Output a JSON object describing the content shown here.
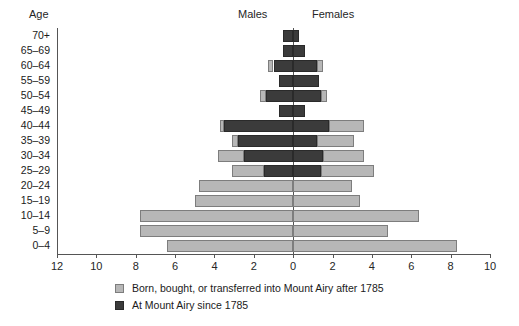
{
  "header": {
    "age_title": "Age",
    "males_title": "Males",
    "females_title": "Females"
  },
  "legend": [
    {
      "key": "after",
      "label": "Born, bought, or transferred into Mount Airy after 1785",
      "color": "#b7b7b7"
    },
    {
      "key": "since",
      "label": "At Mount Airy since 1785",
      "color": "#3b3b3b"
    }
  ],
  "axis": {
    "tick_labels": [
      "12",
      "10",
      "8",
      "6",
      "4",
      "2",
      "0",
      "2",
      "4",
      "6",
      "8",
      "10"
    ],
    "tick_values": [
      -12,
      -10,
      -8,
      -6,
      -4,
      -2,
      0,
      2,
      4,
      6,
      8,
      10
    ],
    "xmin": -12,
    "xmax": 10,
    "zero_label": "0"
  },
  "chart_data": {
    "type": "bar",
    "title": "",
    "subtitle": "",
    "xlabel": "",
    "ylabel": "Age",
    "xlim": [
      -12,
      10
    ],
    "grid": false,
    "legend_position": "bottom-left",
    "orientation": "horizontal-population-pyramid",
    "categories": [
      "70+",
      "65–69",
      "60–64",
      "55–59",
      "50–54",
      "45–49",
      "40–44",
      "35–39",
      "30–34",
      "25–29",
      "20–24",
      "15–19",
      "10–14",
      "5–9",
      "0–4"
    ],
    "series": [
      {
        "name": "Males – At Mount Airy since 1785",
        "side": "left",
        "stack": "dark",
        "values": [
          0.5,
          0.5,
          1.0,
          0.7,
          1.4,
          0.7,
          3.5,
          2.8,
          2.5,
          1.5,
          0.0,
          0.0,
          0.0,
          0.0,
          0.0
        ]
      },
      {
        "name": "Males – Born, bought, or transferred into Mount Airy after 1785",
        "side": "left",
        "stack": "light",
        "values": [
          0.0,
          0.0,
          0.3,
          0.0,
          0.3,
          0.0,
          0.2,
          0.3,
          1.3,
          1.6,
          4.8,
          5.0,
          7.8,
          7.8,
          6.4
        ]
      },
      {
        "name": "Females – At Mount Airy since 1785",
        "side": "right",
        "stack": "dark",
        "values": [
          0.3,
          0.6,
          1.2,
          1.3,
          1.4,
          0.6,
          1.8,
          1.2,
          1.5,
          1.4,
          0.0,
          0.0,
          0.0,
          0.0,
          0.0
        ]
      },
      {
        "name": "Females – Born, bought, or transferred into Mount Airy after 1785",
        "side": "right",
        "stack": "light",
        "values": [
          0.0,
          0.0,
          0.3,
          0.0,
          0.3,
          0.0,
          1.8,
          1.9,
          2.1,
          2.7,
          3.0,
          3.4,
          6.4,
          4.8,
          8.3
        ]
      }
    ],
    "male_totals": [
      0.5,
      0.5,
      1.3,
      0.7,
      1.7,
      0.7,
      3.7,
      3.1,
      3.8,
      3.1,
      4.8,
      5.0,
      7.8,
      7.8,
      6.4
    ],
    "female_totals": [
      0.3,
      0.6,
      1.5,
      1.3,
      1.7,
      0.6,
      3.6,
      3.1,
      3.6,
      4.1,
      3.0,
      3.4,
      6.4,
      4.8,
      8.3
    ]
  }
}
